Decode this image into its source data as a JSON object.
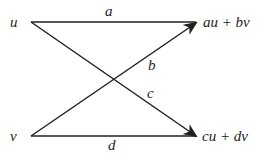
{
  "diagram": {
    "type": "linear-map-flow",
    "colors": {
      "ink": "#231f20",
      "background": "#ffffff"
    },
    "nodes": {
      "u": {
        "label": "u"
      },
      "v": {
        "label": "v"
      },
      "out_top": {
        "label": "au + bv"
      },
      "out_bottom": {
        "label": "cu + dv"
      }
    },
    "edges": [
      {
        "from": "u",
        "to": "out_top",
        "label": "a"
      },
      {
        "from": "v",
        "to": "out_top",
        "label": "b"
      },
      {
        "from": "u",
        "to": "out_bottom",
        "label": "c"
      },
      {
        "from": "v",
        "to": "out_bottom",
        "label": "d"
      }
    ]
  }
}
